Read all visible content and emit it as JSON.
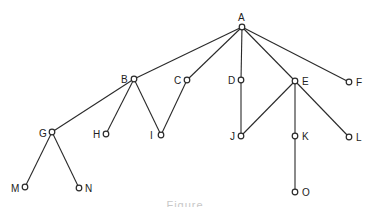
{
  "diagram": {
    "type": "tree",
    "caption": "Figure",
    "colors": {
      "line": "#2a2a2a",
      "node_fill": "#ffffff",
      "label": "#222222"
    },
    "nodes": [
      {
        "id": "A",
        "x": 242,
        "y": 27,
        "lx": 238,
        "ly": 17,
        "anchor": "start"
      },
      {
        "id": "B",
        "x": 134,
        "y": 79,
        "lx": 121,
        "ly": 79,
        "anchor": "start"
      },
      {
        "id": "C",
        "x": 187,
        "y": 80,
        "lx": 174,
        "ly": 80,
        "anchor": "start"
      },
      {
        "id": "D",
        "x": 241,
        "y": 80,
        "lx": 228,
        "ly": 80,
        "anchor": "start"
      },
      {
        "id": "E",
        "x": 295,
        "y": 81,
        "lx": 302,
        "ly": 81,
        "anchor": "start"
      },
      {
        "id": "F",
        "x": 349,
        "y": 82,
        "lx": 356,
        "ly": 82,
        "anchor": "start"
      },
      {
        "id": "G",
        "x": 52,
        "y": 132,
        "lx": 39,
        "ly": 133,
        "anchor": "start"
      },
      {
        "id": "H",
        "x": 106,
        "y": 134,
        "lx": 93,
        "ly": 134,
        "anchor": "start"
      },
      {
        "id": "I",
        "x": 161,
        "y": 135,
        "lx": 150,
        "ly": 135,
        "anchor": "start"
      },
      {
        "id": "J",
        "x": 241,
        "y": 136,
        "lx": 230,
        "ly": 136,
        "anchor": "start"
      },
      {
        "id": "K",
        "x": 295,
        "y": 136,
        "lx": 302,
        "ly": 136,
        "anchor": "start"
      },
      {
        "id": "L",
        "x": 349,
        "y": 137,
        "lx": 356,
        "ly": 137,
        "anchor": "start"
      },
      {
        "id": "M",
        "x": 25,
        "y": 187,
        "lx": 11,
        "ly": 188,
        "anchor": "start"
      },
      {
        "id": "N",
        "x": 79,
        "y": 188,
        "lx": 85,
        "ly": 188,
        "anchor": "start"
      },
      {
        "id": "O",
        "x": 295,
        "y": 192,
        "lx": 302,
        "ly": 192,
        "anchor": "start"
      }
    ],
    "edges": [
      [
        "A",
        "B"
      ],
      [
        "A",
        "C"
      ],
      [
        "A",
        "D"
      ],
      [
        "A",
        "E"
      ],
      [
        "A",
        "F"
      ],
      [
        "B",
        "G"
      ],
      [
        "B",
        "H"
      ],
      [
        "B",
        "I"
      ],
      [
        "C",
        "I"
      ],
      [
        "D",
        "J"
      ],
      [
        "E",
        "J"
      ],
      [
        "E",
        "K"
      ],
      [
        "E",
        "L"
      ],
      [
        "G",
        "M"
      ],
      [
        "G",
        "N"
      ],
      [
        "K",
        "O"
      ]
    ]
  }
}
